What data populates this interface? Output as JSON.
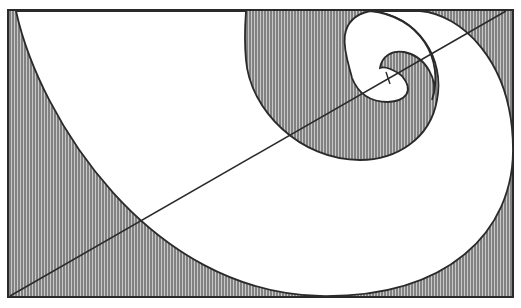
{
  "diagram": {
    "colors": {
      "background": "#ffffff",
      "hatch_line": "#3a3a3a",
      "hatch_bg": "#c9c9c9",
      "outline": "#2a2a2a",
      "spiral_fill": "#ffffff"
    },
    "rectangle": {
      "x": 8,
      "y": 10,
      "width": 505,
      "height": 287
    },
    "diagonal": {
      "x1": 10,
      "y1": 296,
      "x2": 506,
      "y2": 11
    },
    "pole_marker": {
      "x": 388,
      "y": 78
    }
  }
}
